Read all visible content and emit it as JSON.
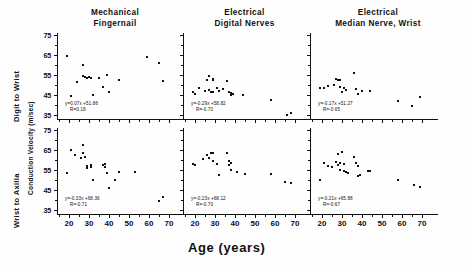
{
  "figure": {
    "xaxis_title": "Age (years)",
    "ylabel_top": "Digit to Wrist",
    "ylabel_bottom": "Wrist to Axilla",
    "ylabel_units": "Conduction Velocity (m/sec)"
  },
  "columns": [
    {
      "line1": "Mechanical",
      "line2": "Fingernail"
    },
    {
      "line1": "Electrical",
      "line2": "Digital Nerves"
    },
    {
      "line1": "Electrical",
      "line2": "Median Nerve, Wrist"
    }
  ],
  "axes": {
    "ytick_labels": [
      "75",
      "65",
      "55",
      "45",
      "35"
    ],
    "ytick_values": [
      75,
      65,
      55,
      45,
      35
    ],
    "xtick_labels": [
      "20",
      "30",
      "40",
      "50",
      "60",
      "70"
    ],
    "xtick_values": [
      20,
      30,
      40,
      50,
      60,
      70
    ],
    "xlim": [
      14,
      73
    ],
    "ylim": [
      33,
      76
    ]
  },
  "chart_data": {
    "type": "scatter",
    "xlabel": "Age (years)",
    "ylabel": "Conduction Velocity (m/sec)",
    "xlim": [
      14,
      73
    ],
    "ylim": [
      33,
      76
    ],
    "grid": false,
    "legend": "none",
    "panels": [
      {
        "row": "Digit to Wrist",
        "column": "Mechanical Fingernail",
        "equation": "y=0.07x +51.86",
        "correlation": "R=0.18",
        "slope": 0.07,
        "intercept": 51.86,
        "r": 0.18,
        "points": [
          {
            "x": 19,
            "y": 64.5
          },
          {
            "x": 21,
            "y": 44.5
          },
          {
            "x": 24,
            "y": 51.5
          },
          {
            "x": 27,
            "y": 60.0
          },
          {
            "x": 27,
            "y": 54.5
          },
          {
            "x": 28,
            "y": 54.0
          },
          {
            "x": 29,
            "y": 53.5
          },
          {
            "x": 30,
            "y": 54.0
          },
          {
            "x": 31,
            "y": 53.5
          },
          {
            "x": 32,
            "y": 45.0
          },
          {
            "x": 35,
            "y": 53.5
          },
          {
            "x": 37,
            "y": 49.0
          },
          {
            "x": 39,
            "y": 55.0
          },
          {
            "x": 40,
            "y": 46.5
          },
          {
            "x": 45,
            "y": 52.5
          },
          {
            "x": 59,
            "y": 64.0
          },
          {
            "x": 65,
            "y": 61.0
          },
          {
            "x": 67,
            "y": 52.0
          }
        ]
      },
      {
        "row": "Digit to Wrist",
        "column": "Electrical Digital Nerves",
        "equation": "y=-0.29x +58.82",
        "correlation": "R=-0.70",
        "slope": -0.29,
        "intercept": 58.82,
        "r": -0.7,
        "points": [
          {
            "x": 19,
            "y": 46.5
          },
          {
            "x": 20,
            "y": 45.5
          },
          {
            "x": 22,
            "y": 48.5
          },
          {
            "x": 25,
            "y": 47.0
          },
          {
            "x": 26,
            "y": 52.5
          },
          {
            "x": 27,
            "y": 54.5
          },
          {
            "x": 27,
            "y": 47.5
          },
          {
            "x": 28,
            "y": 46.5
          },
          {
            "x": 29,
            "y": 53.0
          },
          {
            "x": 29,
            "y": 52.5
          },
          {
            "x": 29,
            "y": 46.5
          },
          {
            "x": 31,
            "y": 48.5
          },
          {
            "x": 32,
            "y": 47.0
          },
          {
            "x": 34,
            "y": 48.0
          },
          {
            "x": 36,
            "y": 52.0
          },
          {
            "x": 37,
            "y": 46.5
          },
          {
            "x": 38,
            "y": 46.0
          },
          {
            "x": 38,
            "y": 45.0
          },
          {
            "x": 39,
            "y": 45.5
          },
          {
            "x": 44,
            "y": 45.0
          },
          {
            "x": 58,
            "y": 42.5
          },
          {
            "x": 66,
            "y": 35.0
          },
          {
            "x": 68,
            "y": 36.0
          }
        ]
      },
      {
        "row": "Digit to Wrist",
        "column": "Electrical Median Nerve, Wrist",
        "equation": "y=-0.17x +51.27",
        "correlation": "R=-0.65",
        "slope": -0.17,
        "intercept": 51.27,
        "r": -0.65,
        "points": [
          {
            "x": 19,
            "y": 48.5
          },
          {
            "x": 21,
            "y": 48.5
          },
          {
            "x": 23,
            "y": 49.5
          },
          {
            "x": 26,
            "y": 50.0
          },
          {
            "x": 27,
            "y": 53.0
          },
          {
            "x": 28,
            "y": 52.5
          },
          {
            "x": 29,
            "y": 52.5
          },
          {
            "x": 29,
            "y": 49.0
          },
          {
            "x": 30,
            "y": 46.5
          },
          {
            "x": 31,
            "y": 48.5
          },
          {
            "x": 32,
            "y": 47.5
          },
          {
            "x": 36,
            "y": 56.0
          },
          {
            "x": 37,
            "y": 48.0
          },
          {
            "x": 38,
            "y": 45.5
          },
          {
            "x": 40,
            "y": 47.0
          },
          {
            "x": 44,
            "y": 47.0
          },
          {
            "x": 58,
            "y": 42.0
          },
          {
            "x": 65,
            "y": 39.5
          },
          {
            "x": 69,
            "y": 44.0
          }
        ]
      },
      {
        "row": "Wrist to Axilla",
        "column": "Mechanical Fingernail",
        "equation": "y=-0.33x +68.36",
        "correlation": "R=-0.71",
        "slope": -0.33,
        "intercept": 68.36,
        "r": -0.71,
        "points": [
          {
            "x": 19,
            "y": 53.5
          },
          {
            "x": 21,
            "y": 65.0
          },
          {
            "x": 23,
            "y": 62.5
          },
          {
            "x": 26,
            "y": 61.0
          },
          {
            "x": 27,
            "y": 67.5
          },
          {
            "x": 27,
            "y": 63.5
          },
          {
            "x": 28,
            "y": 61.5
          },
          {
            "x": 29,
            "y": 57.0
          },
          {
            "x": 29,
            "y": 56.0
          },
          {
            "x": 31,
            "y": 57.5
          },
          {
            "x": 31,
            "y": 56.5
          },
          {
            "x": 32,
            "y": 50.0
          },
          {
            "x": 37,
            "y": 57.5
          },
          {
            "x": 38,
            "y": 58.0
          },
          {
            "x": 38,
            "y": 56.5
          },
          {
            "x": 39,
            "y": 53.5
          },
          {
            "x": 40,
            "y": 46.0
          },
          {
            "x": 43,
            "y": 50.0
          },
          {
            "x": 45,
            "y": 54.0
          },
          {
            "x": 53,
            "y": 54.0
          },
          {
            "x": 65,
            "y": 39.5
          },
          {
            "x": 67,
            "y": 41.5
          }
        ]
      },
      {
        "row": "Wrist to Axilla",
        "column": "Electrical Digital Nerves",
        "equation": "y=-0.23x +68.12",
        "correlation": "R=-0.70",
        "slope": -0.23,
        "intercept": 68.12,
        "r": -0.7,
        "points": [
          {
            "x": 19,
            "y": 58.0
          },
          {
            "x": 20,
            "y": 57.5
          },
          {
            "x": 24,
            "y": 60.5
          },
          {
            "x": 26,
            "y": 62.5
          },
          {
            "x": 27,
            "y": 61.0
          },
          {
            "x": 28,
            "y": 63.5
          },
          {
            "x": 29,
            "y": 63.5
          },
          {
            "x": 29,
            "y": 59.5
          },
          {
            "x": 31,
            "y": 58.0
          },
          {
            "x": 32,
            "y": 52.5
          },
          {
            "x": 36,
            "y": 63.5
          },
          {
            "x": 37,
            "y": 59.5
          },
          {
            "x": 37,
            "y": 57.5
          },
          {
            "x": 38,
            "y": 58.5
          },
          {
            "x": 38,
            "y": 55.0
          },
          {
            "x": 41,
            "y": 54.0
          },
          {
            "x": 45,
            "y": 53.0
          },
          {
            "x": 58,
            "y": 53.0
          },
          {
            "x": 65,
            "y": 49.0
          },
          {
            "x": 68,
            "y": 48.5
          }
        ]
      },
      {
        "row": "Wrist to Axilla",
        "column": "Electrical Median Nerve, Wrist",
        "equation": "y=-0.21x +65.88",
        "correlation": "R=-0.67",
        "slope": -0.21,
        "intercept": 65.88,
        "r": -0.67,
        "points": [
          {
            "x": 19,
            "y": 50.0
          },
          {
            "x": 21,
            "y": 58.5
          },
          {
            "x": 23,
            "y": 57.0
          },
          {
            "x": 25,
            "y": 56.5
          },
          {
            "x": 27,
            "y": 59.0
          },
          {
            "x": 28,
            "y": 63.0
          },
          {
            "x": 28,
            "y": 57.5
          },
          {
            "x": 29,
            "y": 58.5
          },
          {
            "x": 29,
            "y": 55.0
          },
          {
            "x": 30,
            "y": 64.0
          },
          {
            "x": 31,
            "y": 58.0
          },
          {
            "x": 31,
            "y": 54.5
          },
          {
            "x": 32,
            "y": 54.0
          },
          {
            "x": 33,
            "y": 53.5
          },
          {
            "x": 36,
            "y": 61.5
          },
          {
            "x": 37,
            "y": 58.5
          },
          {
            "x": 38,
            "y": 57.0
          },
          {
            "x": 38,
            "y": 52.0
          },
          {
            "x": 39,
            "y": 52.5
          },
          {
            "x": 43,
            "y": 54.5
          },
          {
            "x": 44,
            "y": 54.5
          },
          {
            "x": 58,
            "y": 50.0
          },
          {
            "x": 66,
            "y": 47.5
          },
          {
            "x": 69,
            "y": 46.5
          }
        ]
      }
    ]
  }
}
